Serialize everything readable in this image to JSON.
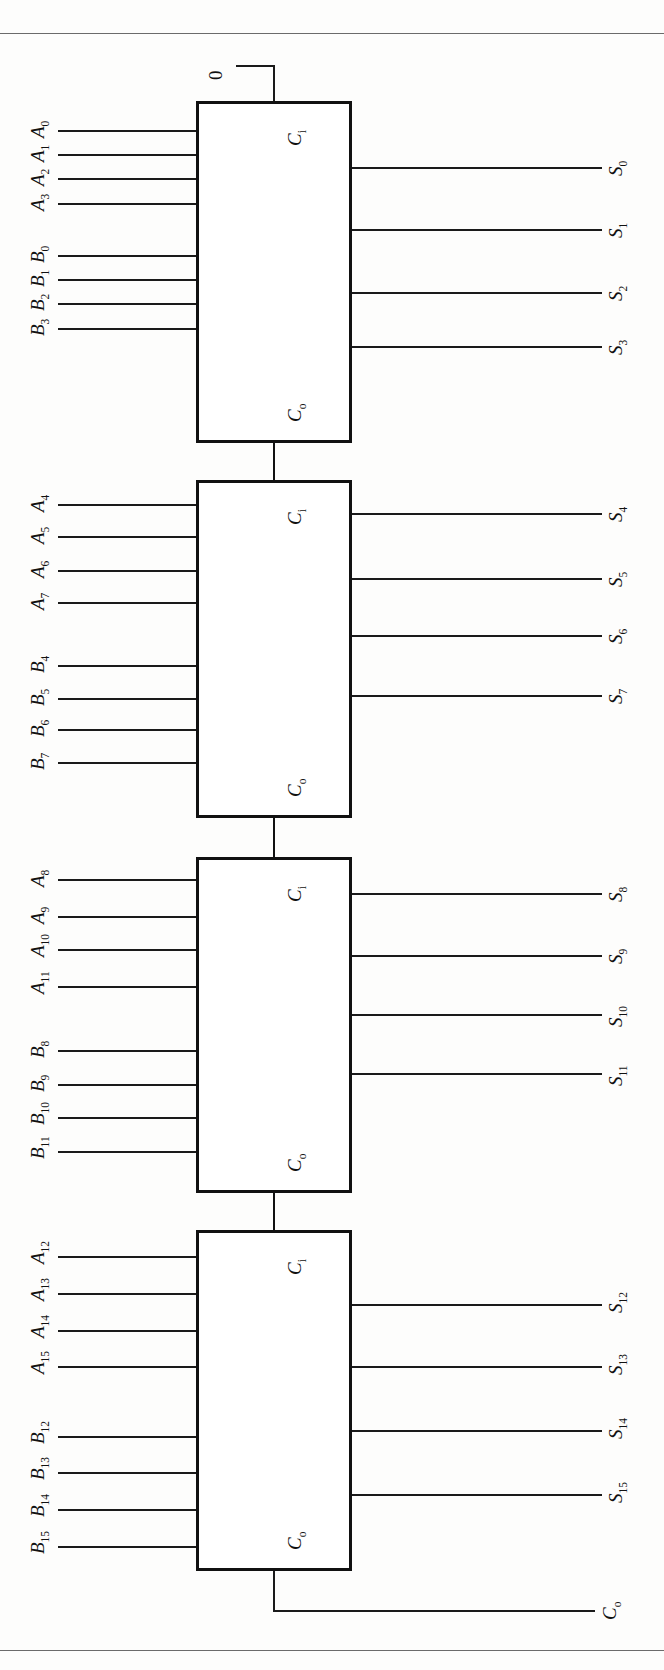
{
  "figure": {
    "kind": "logic-diagram",
    "orientation": "rotated-90-ccw"
  },
  "constant_input": {
    "label": "0"
  },
  "blocks": [
    {
      "id": "adder-0",
      "carry_in_label": "C",
      "carry_in_sub": "i",
      "carry_out_label": "C",
      "carry_out_sub": "o",
      "a_inputs": [
        "A0",
        "A1",
        "A2",
        "A3"
      ],
      "b_inputs": [
        "B0",
        "B1",
        "B2",
        "B3"
      ],
      "sum_outputs": [
        "S0",
        "S1",
        "S2",
        "S3"
      ]
    },
    {
      "id": "adder-1",
      "carry_in_label": "C",
      "carry_in_sub": "i",
      "carry_out_label": "C",
      "carry_out_sub": "o",
      "a_inputs": [
        "A4",
        "A5",
        "A6",
        "A7"
      ],
      "b_inputs": [
        "B4",
        "B5",
        "B6",
        "B7"
      ],
      "sum_outputs": [
        "S4",
        "S5",
        "S6",
        "S7"
      ]
    },
    {
      "id": "adder-2",
      "carry_in_label": "C",
      "carry_in_sub": "i",
      "carry_out_label": "C",
      "carry_out_sub": "o",
      "a_inputs": [
        "A8",
        "A9",
        "A10",
        "A11"
      ],
      "b_inputs": [
        "B8",
        "B9",
        "B10",
        "B11"
      ],
      "sum_outputs": [
        "S8",
        "S9",
        "S10",
        "S11"
      ]
    },
    {
      "id": "adder-3",
      "carry_in_label": "C",
      "carry_in_sub": "i",
      "carry_out_label": "C",
      "carry_out_sub": "o",
      "a_inputs": [
        "A12",
        "A13",
        "A14",
        "A15"
      ],
      "b_inputs": [
        "B12",
        "B13",
        "B14",
        "B15"
      ],
      "sum_outputs": [
        "S12",
        "S13",
        "S14",
        "S15"
      ]
    }
  ],
  "final_carry_out": {
    "label": "C",
    "sub": "o"
  },
  "labels": {
    "a0": "A",
    "a1": "A",
    "a2": "A",
    "a3": "A",
    "b0": "B",
    "b1": "B",
    "b2": "B",
    "b3": "B",
    "s": "S",
    "c": "C"
  },
  "subscripts": {
    "a": [
      "0",
      "1",
      "2",
      "3",
      "4",
      "5",
      "6",
      "7",
      "8",
      "9",
      "10",
      "11",
      "12",
      "13",
      "14",
      "15"
    ],
    "b": [
      "0",
      "1",
      "2",
      "3",
      "4",
      "5",
      "6",
      "7",
      "8",
      "9",
      "10",
      "11",
      "12",
      "13",
      "14",
      "15"
    ],
    "s": [
      "0",
      "1",
      "2",
      "3",
      "4",
      "5",
      "6",
      "7",
      "8",
      "9",
      "10",
      "11",
      "12",
      "13",
      "14",
      "15"
    ],
    "ci": "i",
    "co": "o"
  },
  "colors": {
    "ink": "#111111",
    "rule": "#6b6b6b",
    "paper": "#fdfdfc"
  }
}
